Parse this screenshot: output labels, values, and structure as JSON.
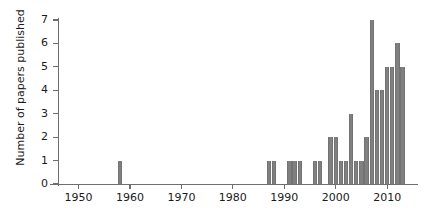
{
  "chart_data": {
    "type": "bar",
    "title": "",
    "xlabel": "",
    "ylabel": "Number of papers published",
    "xlim": [
      1946,
      2016
    ],
    "ylim": [
      0,
      7.3
    ],
    "grid": false,
    "legend": null,
    "bar_color": "#808080",
    "axis_color": "#6e6e6e",
    "text_color": "#1a1a1a",
    "xticks": [
      1950,
      1960,
      1970,
      1980,
      1990,
      2000,
      2010
    ],
    "xtick_labels": [
      "1950",
      "1960",
      "1970",
      "1980",
      "1990",
      "2000",
      "2010"
    ],
    "yticks": [
      0,
      1,
      2,
      3,
      4,
      5,
      6,
      7
    ],
    "ytick_labels": [
      "0",
      "1",
      "2",
      "3",
      "4",
      "5",
      "6",
      "7"
    ],
    "x": [
      1958,
      1987,
      1988,
      1991,
      1992,
      1993,
      1996,
      1997,
      1999,
      2000,
      2001,
      2002,
      2003,
      2004,
      2005,
      2006,
      2007,
      2008,
      2009,
      2010,
      2011,
      2012,
      2013
    ],
    "values": [
      1,
      1,
      1,
      1,
      1,
      1,
      1,
      1,
      2,
      2,
      1,
      1,
      3,
      1,
      1,
      2,
      7,
      4,
      4,
      5,
      5,
      6,
      5
    ]
  }
}
